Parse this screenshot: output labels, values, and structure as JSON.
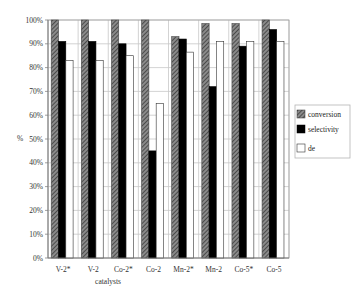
{
  "chart_data": {
    "type": "bar",
    "title": "",
    "xlabel": "catalysts",
    "ylabel": "%",
    "ylim": [
      0,
      100
    ],
    "yticks": [
      "0%",
      "10%",
      "20%",
      "30%",
      "40%",
      "50%",
      "60%",
      "70%",
      "80%",
      "90%",
      "100%"
    ],
    "grid": true,
    "legend_position": "right",
    "categories": [
      "V-2*",
      "V-2",
      "Co-2*",
      "Co-2",
      "Mn-2*",
      "Mn-2",
      "Co-5*",
      "Co-5"
    ],
    "series": [
      {
        "name": "conversion",
        "pattern": "hatched",
        "color": "#555555",
        "values": [
          100,
          100,
          100,
          100,
          93,
          98.5,
          98.5,
          100
        ]
      },
      {
        "name": "selectivity",
        "pattern": "solid",
        "color": "#000000",
        "values": [
          91,
          91,
          90,
          45,
          92,
          72,
          89,
          96
        ]
      },
      {
        "name": "de",
        "pattern": "empty",
        "color": "#ffffff",
        "values": [
          83,
          83,
          85,
          65,
          86.5,
          91,
          91,
          91
        ]
      }
    ]
  },
  "legend": {
    "items": [
      "conversion",
      "selectivity",
      "de"
    ]
  },
  "axes": {
    "x_title": "catalysts",
    "y_title": "%"
  }
}
